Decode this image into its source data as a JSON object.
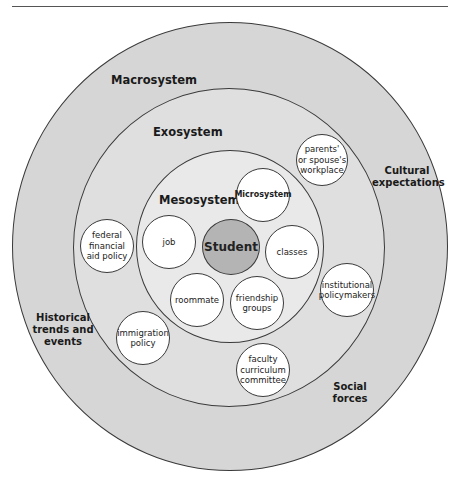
{
  "figure": {
    "colors": {
      "macrosystem_fill": "#d6d6d6",
      "exosystem_fill": "#dfdfdf",
      "mesosystem_fill": "#e9e9e9",
      "student_fill": "#b4b4b4",
      "node_fill": "#ffffff",
      "stroke": "#3a3a3a"
    },
    "systems": {
      "macrosystem": "Macrosystem",
      "exosystem": "Exosystem",
      "mesosystem": "Mesosystem",
      "microsystem": "Microsystem"
    },
    "center": {
      "label": "Student"
    },
    "mesosystem_nodes": [
      {
        "label": "job"
      },
      {
        "label": "classes"
      },
      {
        "label": "roommate"
      },
      {
        "label": "friendship\ngroups"
      }
    ],
    "exosystem_nodes": [
      {
        "label": "parents'\nor spouse's\nworkplace"
      },
      {
        "label": "federal\nfinancial\naid policy"
      },
      {
        "label": "institutional\npolicymakers"
      },
      {
        "label": "immigration\npolicy"
      },
      {
        "label": "faculty\ncurriculum\ncommittee"
      }
    ],
    "macrosystem_forces": [
      {
        "label": "Cultural\nexpectations"
      },
      {
        "label": "Historical\ntrends and\nevents"
      },
      {
        "label": "Social\nforces"
      }
    ]
  }
}
